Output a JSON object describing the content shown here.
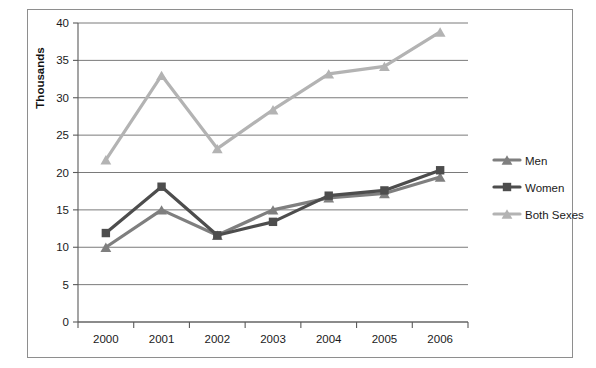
{
  "chart_data": {
    "type": "line",
    "title": "",
    "xlabel": "",
    "ylabel": "Thousands",
    "categories": [
      "2000",
      "2001",
      "2002",
      "2003",
      "2004",
      "2005",
      "2006"
    ],
    "x": [
      2000,
      2001,
      2002,
      2003,
      2004,
      2005,
      2006
    ],
    "ylim": [
      0,
      40
    ],
    "yticks": [
      0,
      5,
      10,
      15,
      20,
      25,
      30,
      35,
      40
    ],
    "ytick_labels": [
      "0",
      "5",
      "10",
      "15",
      "20",
      "25",
      "30",
      "35",
      "40"
    ],
    "grid": "horizontal",
    "legend_position": "right",
    "series": [
      {
        "name": "Men",
        "color": "#7f7f7f",
        "marker": "triangle",
        "values": [
          10.0,
          15.0,
          11.6,
          15.0,
          16.6,
          17.2,
          19.4
        ]
      },
      {
        "name": "Women",
        "color": "#4d4d4d",
        "marker": "square",
        "values": [
          11.9,
          18.1,
          11.6,
          13.4,
          16.9,
          17.6,
          20.3
        ]
      },
      {
        "name": "Both Sexes",
        "color": "#b3b3b3",
        "marker": "triangle",
        "values": [
          21.7,
          33.0,
          23.2,
          28.4,
          33.2,
          34.2,
          38.8
        ]
      }
    ]
  },
  "legend": {
    "items": [
      {
        "label": "Men"
      },
      {
        "label": "Women"
      },
      {
        "label": "Both Sexes"
      }
    ]
  },
  "axis": {
    "y_title": "Thousands"
  }
}
